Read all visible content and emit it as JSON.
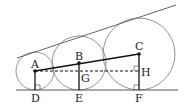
{
  "diagram": {
    "colors": {
      "stroke": "#555555",
      "thick": "#111111",
      "circle": "#888888"
    },
    "points": {
      "A": {
        "label": "A",
        "x": 35,
        "y": 71
      },
      "B": {
        "label": "B",
        "x": 79,
        "y": 63
      },
      "C": {
        "label": "C",
        "x": 139,
        "y": 54
      },
      "D": {
        "label": "D",
        "x": 35,
        "y": 90
      },
      "E": {
        "label": "E",
        "x": 79,
        "y": 90
      },
      "F": {
        "label": "F",
        "x": 139,
        "y": 90
      },
      "G": {
        "label": "G",
        "x": 79,
        "y": 71
      },
      "H": {
        "label": "H",
        "x": 139,
        "y": 71
      }
    },
    "circles": [
      {
        "name": "small-circle",
        "cx": 35,
        "cy": 71,
        "r": 19
      },
      {
        "name": "middle-circle",
        "cx": 79,
        "cy": 63,
        "r": 27
      },
      {
        "name": "large-circle",
        "cx": 139,
        "cy": 54,
        "r": 36
      }
    ],
    "labels": {
      "A": "A",
      "B": "B",
      "C": "C",
      "D": "D",
      "E": "E",
      "F": "F",
      "G": "G",
      "H": "H"
    }
  }
}
